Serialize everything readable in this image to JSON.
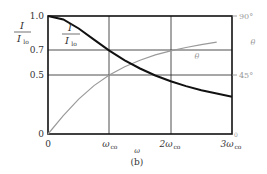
{
  "chart_data": {
    "type": "line",
    "title": "",
    "caption": "(b)",
    "xlabel": "ω",
    "ylabel_left": "I / I_lo",
    "ylabel_right": "θ",
    "x_ticks": [
      "0",
      "ω_co",
      "2ω_co",
      "3ω_co"
    ],
    "y_left_ticks": [
      "0",
      "0.5",
      "0.7",
      "1.0"
    ],
    "y_right_ticks": [
      "45°",
      "90°"
    ],
    "xlim": [
      0,
      3
    ],
    "ylim_left": [
      0,
      1.0
    ],
    "ylim_right": [
      0,
      90
    ],
    "grid": true,
    "x": [
      0,
      0.25,
      0.5,
      0.75,
      1.0,
      1.25,
      1.5,
      1.75,
      2.0,
      2.25,
      2.5,
      2.75,
      3.0
    ],
    "series": [
      {
        "name": "I/I_lo",
        "axis": "left",
        "color": "#1a1a1a",
        "values": [
          1.0,
          0.97,
          0.894,
          0.8,
          0.707,
          0.625,
          0.555,
          0.496,
          0.447,
          0.406,
          0.371,
          0.342,
          0.316
        ]
      },
      {
        "name": "θ",
        "axis": "right",
        "color": "#9a9a9a",
        "values": [
          0,
          14.0,
          26.6,
          36.9,
          45.0,
          51.3,
          56.3,
          60.3,
          63.4,
          66.0,
          68.2,
          70.0,
          71.6
        ]
      }
    ],
    "annotations": [
      {
        "text": "I / I_lo",
        "near": "I/I_lo curve"
      },
      {
        "text": "θ",
        "near": "θ curve"
      }
    ]
  },
  "labels": {
    "y_left_num": "I",
    "y_left_den": "Ilo",
    "y_left_den_main": "I",
    "y_left_den_sub": "lo",
    "curve_num": "I",
    "curve_den_main": "I",
    "curve_den_sub": "lo",
    "theta": "θ",
    "theta_right": "θ",
    "x_axis": "ω",
    "caption": "(b)",
    "tick_1_0": "1.0",
    "tick_0_7": "0.7",
    "tick_0_5": "0.5",
    "tick_0": "0",
    "tick_90": "90°",
    "tick_45": "45°",
    "xtick_0": "0",
    "xtick_w": "ω",
    "xtick_w_sub": "co",
    "xtick_2w": "2ω",
    "xtick_2w_sub": "co",
    "xtick_3w": "3ω",
    "xtick_3w_sub": "co",
    "right_zero": "0"
  }
}
